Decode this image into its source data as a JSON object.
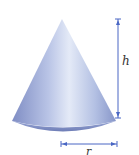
{
  "diagram": {
    "shape": "right circular cone",
    "labels": {
      "height": "h",
      "radius": "r"
    },
    "colors": {
      "cone_light": "#dfe6f5",
      "cone_mid": "#a9b6dd",
      "cone_dark": "#6f7fb8",
      "dimension_line": "#4a67c4",
      "label": "#333333"
    }
  }
}
